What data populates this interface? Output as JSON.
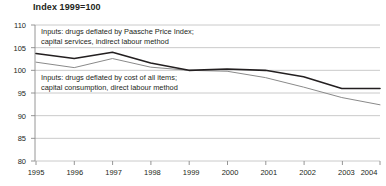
{
  "chart_data": {
    "type": "line",
    "title": "Index 1999=100",
    "xlabel": "",
    "ylabel": "",
    "xlim": [
      1995,
      2004
    ],
    "ylim": [
      80,
      110
    ],
    "yticks": [
      80,
      85,
      90,
      95,
      100,
      105,
      110
    ],
    "xticks": [
      1995,
      1996,
      1997,
      1998,
      1999,
      2000,
      2001,
      2002,
      2003,
      2004
    ],
    "grid": true,
    "legend": "annotations-inline",
    "x": [
      1995,
      1996,
      1997,
      1998,
      1999,
      2000,
      2001,
      2002,
      2003,
      2004
    ],
    "series": [
      {
        "name": "Inputs: drugs deflated by Paasche Price Index; capital services, indirect labour method",
        "color": "#231f20",
        "width": 1.6,
        "values": [
          103.7,
          102.6,
          104.0,
          101.6,
          100.0,
          100.3,
          100.0,
          98.6,
          96.0,
          96.0
        ]
      },
      {
        "name": "Inputs: drugs deflated by cost of all items; capital consumption, direct labour method",
        "color": "#8a8a8a",
        "width": 1.0,
        "values": [
          101.8,
          100.6,
          102.6,
          100.7,
          100.0,
          99.8,
          98.4,
          96.3,
          94.0,
          92.4
        ]
      }
    ],
    "annotations": [
      {
        "id": "annotation-upper",
        "lines": [
          "Inputs: drugs deflated by Paasche Price Index;",
          "capital services, indirect labour method"
        ]
      },
      {
        "id": "annotation-lower",
        "lines": [
          "Inputs: drugs deflated by cost of all items;",
          "capital consumption, direct labour method"
        ]
      }
    ],
    "colors": {
      "series_dark": "#231f20",
      "series_grey": "#8a8a8a",
      "gridline": "#bcbcbc",
      "axis": "#8a8a8a",
      "text": "#231f20",
      "background": "#ffffff"
    }
  }
}
